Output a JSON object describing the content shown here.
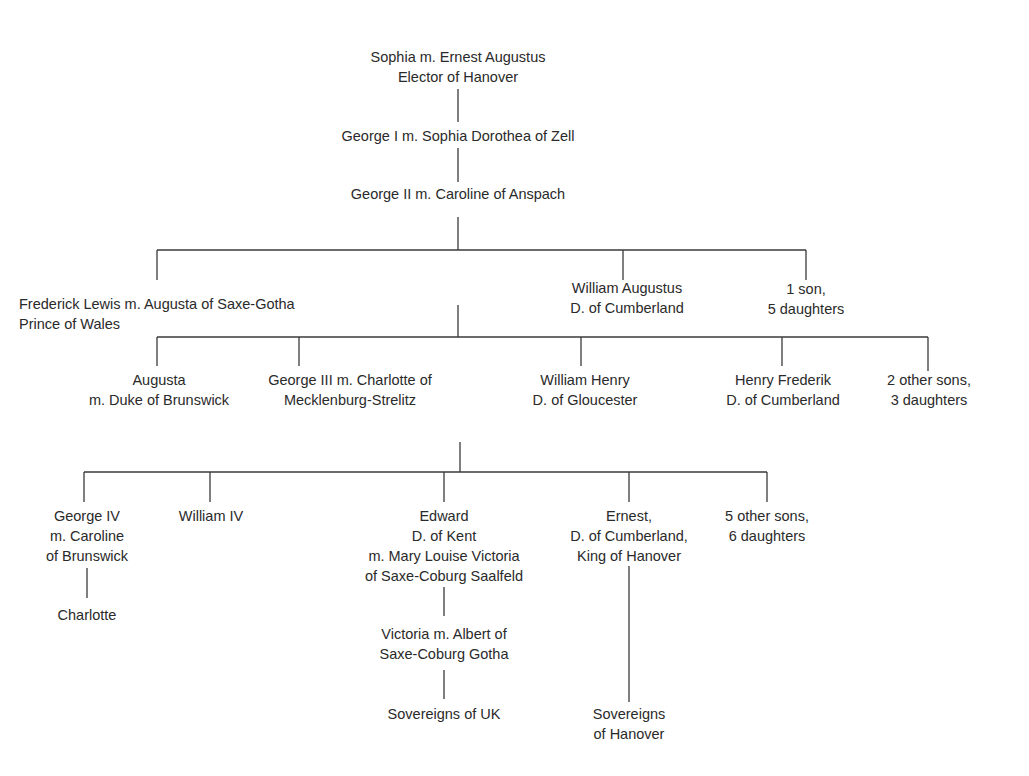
{
  "diagram": {
    "type": "family-tree",
    "background": "#ffffff",
    "line_color": "#3a3a3a",
    "text_color": "#2a2a2a"
  },
  "nodes": {
    "sophia": {
      "lines": [
        "Sophia m. Ernest Augustus",
        "Elector of Hanover"
      ]
    },
    "george1": {
      "lines": [
        "George I m. Sophia Dorothea of Zell"
      ]
    },
    "george2": {
      "lines": [
        "George II m. Caroline of Anspach"
      ]
    },
    "frederick": {
      "lines": [
        "Frederick Lewis m. Augusta of Saxe-Gotha",
        "Prince of Wales"
      ]
    },
    "william_augustus": {
      "lines": [
        "William Augustus",
        "D. of Cumberland"
      ]
    },
    "other_children_g2": {
      "lines": [
        "1 son,",
        "5 daughters"
      ]
    },
    "augusta": {
      "lines": [
        "Augusta",
        "m. Duke of Brunswick"
      ]
    },
    "george3": {
      "lines": [
        "George III  m. Charlotte of",
        "Mecklenburg-Strelitz"
      ]
    },
    "william_henry": {
      "lines": [
        "William Henry",
        "D. of Gloucester"
      ]
    },
    "henry_frederik": {
      "lines": [
        "Henry Frederik",
        "D. of Cumberland"
      ]
    },
    "other_children_fl": {
      "lines": [
        "2 other sons,",
        "3 daughters"
      ]
    },
    "george4": {
      "lines": [
        "George IV",
        "m. Caroline",
        "of Brunswick"
      ]
    },
    "charlotte": {
      "lines": [
        "Charlotte"
      ]
    },
    "william4": {
      "lines": [
        "William IV"
      ]
    },
    "edward": {
      "lines": [
        "Edward",
        "D. of Kent",
        "m. Mary Louise Victoria",
        "of Saxe-Coburg Saalfeld"
      ]
    },
    "victoria": {
      "lines": [
        "Victoria m. Albert of",
        "Saxe-Coburg Gotha"
      ]
    },
    "sovereigns_uk": {
      "lines": [
        "Sovereigns of UK"
      ]
    },
    "ernest": {
      "lines": [
        "Ernest,",
        "D. of Cumberland,",
        "King of Hanover"
      ]
    },
    "sovereigns_hanover": {
      "lines": [
        "Sovereigns",
        "of Hanover"
      ]
    },
    "other_children_g3": {
      "lines": [
        "5 other sons,",
        "6 daughters"
      ]
    }
  }
}
